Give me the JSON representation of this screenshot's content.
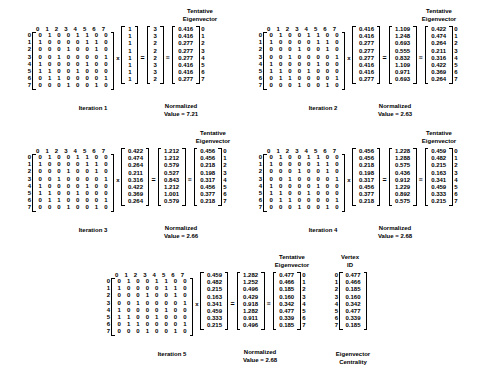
{
  "figure": {
    "title_hidden": "",
    "column_headers": [
      "0",
      "1",
      "2",
      "3",
      "4",
      "5",
      "6",
      "7"
    ],
    "row_labels": [
      "0",
      "1",
      "2",
      "3",
      "4",
      "5",
      "6",
      "7"
    ],
    "adjacency_matrix": [
      [
        "0",
        "1",
        "0",
        "0",
        "1",
        "1",
        "0",
        "0"
      ],
      [
        "1",
        "0",
        "0",
        "0",
        "0",
        "1",
        "1",
        "0"
      ],
      [
        "0",
        "0",
        "0",
        "1",
        "0",
        "0",
        "1",
        "0"
      ],
      [
        "0",
        "0",
        "1",
        "0",
        "0",
        "0",
        "0",
        "1"
      ],
      [
        "1",
        "0",
        "0",
        "0",
        "0",
        "1",
        "0",
        "0"
      ],
      [
        "1",
        "1",
        "0",
        "0",
        "1",
        "0",
        "0",
        "0"
      ],
      [
        "0",
        "1",
        "1",
        "0",
        "0",
        "0",
        "0",
        "1"
      ],
      [
        "0",
        "0",
        "0",
        "1",
        "0",
        "0",
        "1",
        "0"
      ]
    ],
    "labels": {
      "tentative_eigenvector": "Tentative\nEigenvector",
      "tentative_line1": "Tentative",
      "tentative_line2": "Eigenvector",
      "normalized_line1": "Normalized",
      "vertex_line1": "Vertex",
      "vertex_line2": "ID",
      "centrality_line1": "Eigenvector",
      "centrality_line2": "Centrality",
      "times": "x",
      "equals": "=",
      "approx": "≡"
    },
    "iterations": [
      {
        "name": "Iteration 1",
        "input_vector": [
          "1",
          "1",
          "1",
          "1",
          "1",
          "1",
          "1",
          "1"
        ],
        "product_vector": [
          "3",
          "3",
          "2",
          "2",
          "2",
          "3",
          "3",
          "2"
        ],
        "tentative_eigenvector": [
          "0.416",
          "0.416",
          "0.277",
          "0.277",
          "0.277",
          "0.416",
          "0.416",
          "0.277"
        ],
        "normalized_value_label": "Value = 7.21",
        "normalized_value": "7.21"
      },
      {
        "name": "Iteration 2",
        "input_vector": [
          "0.416",
          "0.416",
          "0.277",
          "0.277",
          "0.277",
          "0.416",
          "0.416",
          "0.277"
        ],
        "product_vector": [
          "1.109",
          "1.248",
          "0.693",
          "0.555",
          "0.832",
          "1.109",
          "0.971",
          "0.693"
        ],
        "tentative_eigenvector": [
          "0.422",
          "0.474",
          "0.264",
          "0.211",
          "0.316",
          "0.422",
          "0.369",
          "0.264"
        ],
        "normalized_value_label": "Value = 2.63",
        "normalized_value": "2.63"
      },
      {
        "name": "Iteration 3",
        "input_vector": [
          "0.422",
          "0.474",
          "0.264",
          "0.211",
          "0.316",
          "0.422",
          "0.369",
          "0.264"
        ],
        "product_vector": [
          "1.212",
          "1.212",
          "0.579",
          "0.527",
          "0.843",
          "1.212",
          "1.001",
          "0.579"
        ],
        "tentative_eigenvector": [
          "0.456",
          "0.456",
          "0.218",
          "0.198",
          "0.317",
          "0.456",
          "0.377",
          "0.218"
        ],
        "normalized_value_label": "Value = 2.66",
        "normalized_value": "2.66"
      },
      {
        "name": "Iteration 4",
        "input_vector": [
          "0.456",
          "0.456",
          "0.218",
          "0.198",
          "0.317",
          "0.456",
          "0.377",
          "0.218"
        ],
        "product_vector": [
          "1.228",
          "1.288",
          "0.575",
          "0.436",
          "0.912",
          "1.229",
          "0.892",
          "0.575"
        ],
        "tentative_eigenvector": [
          "0.459",
          "0.482",
          "0.215",
          "0.163",
          "0.341",
          "0.459",
          "0.333",
          "0.215"
        ],
        "normalized_value_label": "Value = 2.68",
        "normalized_value": "2.68"
      },
      {
        "name": "Iteration 5",
        "input_vector": [
          "0.459",
          "0.482",
          "0.215",
          "0.163",
          "0.341",
          "0.459",
          "0.333",
          "0.215"
        ],
        "product_vector": [
          "1.282",
          "1.252",
          "0.496",
          "0.429",
          "0.918",
          "1.282",
          "0.911",
          "0.496"
        ],
        "tentative_eigenvector": [
          "0.477",
          "0.466",
          "0.185",
          "0.160",
          "0.342",
          "0.477",
          "0.339",
          "0.185"
        ],
        "normalized_value_label": "Value = 2.68",
        "normalized_value": "2.68"
      }
    ],
    "final_result": {
      "vertex_ids": [
        "0",
        "1",
        "2",
        "3",
        "4",
        "5",
        "6",
        "7"
      ],
      "values": [
        "0.477",
        "0.466",
        "0.185",
        "0.160",
        "0.342",
        "0.477",
        "0.339",
        "0.185"
      ]
    }
  }
}
